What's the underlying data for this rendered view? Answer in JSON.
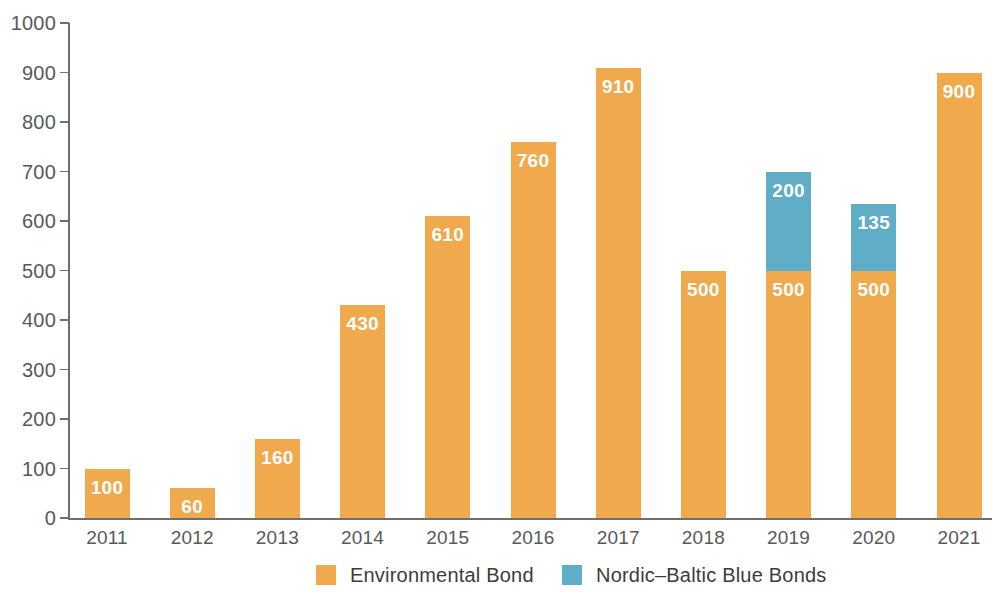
{
  "chart_data": {
    "type": "bar",
    "stacked": true,
    "title": "",
    "subtitle": "",
    "xlabel": "",
    "ylabel": "",
    "categories": [
      "2011",
      "2012",
      "2013",
      "2014",
      "2015",
      "2016",
      "2017",
      "2018",
      "2019",
      "2020",
      "2021"
    ],
    "series": [
      {
        "name": "Environmental Bond",
        "color": "#f0aa4d",
        "values": [
          100,
          60,
          160,
          430,
          610,
          760,
          910,
          500,
          500,
          500,
          900
        ]
      },
      {
        "name": "Nordic-Baltic Blue Bonds",
        "color": "#5fadc7",
        "values": [
          0,
          0,
          0,
          0,
          0,
          0,
          0,
          0,
          200,
          135,
          0
        ]
      }
    ],
    "totals": [
      100,
      60,
      160,
      430,
      610,
      760,
      910,
      500,
      700,
      635,
      900
    ],
    "data_labels": [
      [
        "100"
      ],
      [
        "60"
      ],
      [
        "160"
      ],
      [
        "430"
      ],
      [
        "610"
      ],
      [
        "760"
      ],
      [
        "910"
      ],
      [
        "500"
      ],
      [
        "500",
        "200"
      ],
      [
        "500",
        "135"
      ],
      [
        "900"
      ]
    ],
    "ylim": [
      0,
      1000
    ],
    "y_ticks": [
      0,
      100,
      200,
      300,
      400,
      500,
      600,
      700,
      800,
      900,
      1000
    ],
    "y_tick_labels": [
      "0",
      "100",
      "200",
      "300",
      "400",
      "500",
      "600",
      "700",
      "800",
      "900",
      "1000"
    ],
    "grid": false,
    "legend_position": "bottom"
  },
  "legend": {
    "items": [
      {
        "label": "Environmental Bond",
        "swatch": "primary"
      },
      {
        "label": "Nordic–Baltic Blue Bonds",
        "swatch": "secondary"
      }
    ]
  },
  "colors": {
    "primary": "#f0aa4d",
    "secondary": "#5fadc7",
    "axis": "#6d6e70",
    "tick_text": "#58595b",
    "legend_text": "#3c3c3e",
    "value_text": "#ffffff",
    "background": "#ffffff"
  }
}
